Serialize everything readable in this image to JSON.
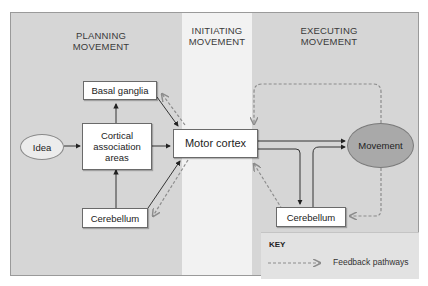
{
  "columns": {
    "planning": {
      "line1": "PLANNING",
      "line2": "MOVEMENT"
    },
    "initiating": {
      "line1": "INITIATING",
      "line2": "MOVEMENT"
    },
    "executing": {
      "line1": "EXECUTING",
      "line2": "MOVEMENT"
    }
  },
  "nodes": {
    "idea": "Idea",
    "basal_ganglia": "Basal ganglia",
    "cortical_line1": "Cortical",
    "cortical_line2": "association",
    "cortical_line3": "areas",
    "cerebellum_left": "Cerebellum",
    "motor_cortex": "Motor cortex",
    "movement": "Movement",
    "cerebellum_right": "Cerebellum"
  },
  "key": {
    "title": "KEY",
    "feedback_label": "Feedback pathways"
  },
  "colors": {
    "panel_bg": "#d6d6d6",
    "middle_column_bg": "#f2f2f2",
    "idea_fill": "#ececec",
    "movement_fill": "#a9a9a9",
    "solid_arrow": "#222222",
    "feedback_arrow": "#8c8c8c"
  }
}
